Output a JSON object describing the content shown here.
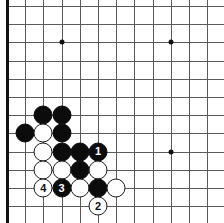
{
  "diagram": {
    "kind": "go-board-diagram",
    "board": {
      "width_px": 224,
      "height_px": 223,
      "origin_x": 7,
      "origin_y": 6,
      "spacing": 18.2,
      "cols": 12,
      "rows": 12,
      "line_color": "#5a5a5a",
      "edge_color": "#111111",
      "background": "#ffffff"
    },
    "star_points": [
      {
        "name": "star-point-top-left",
        "col": 3,
        "row": 2
      },
      {
        "name": "star-point-top-right",
        "col": 9,
        "row": 2
      },
      {
        "name": "star-point-right",
        "col": 9,
        "row": 8
      }
    ],
    "stones": [
      {
        "name": "black-stone-a",
        "color": "black",
        "col": 2,
        "row": 6,
        "label": ""
      },
      {
        "name": "black-stone-b",
        "color": "black",
        "col": 3,
        "row": 6,
        "label": ""
      },
      {
        "name": "black-stone-c",
        "color": "black",
        "col": 1,
        "row": 7,
        "label": ""
      },
      {
        "name": "white-stone-a",
        "color": "white",
        "col": 2,
        "row": 7,
        "label": ""
      },
      {
        "name": "black-stone-d",
        "color": "black",
        "col": 3,
        "row": 7,
        "label": ""
      },
      {
        "name": "white-stone-b",
        "color": "white",
        "col": 2,
        "row": 8,
        "label": ""
      },
      {
        "name": "black-stone-e",
        "color": "black",
        "col": 3,
        "row": 8,
        "label": ""
      },
      {
        "name": "black-stone-f",
        "color": "black",
        "col": 4,
        "row": 8,
        "label": ""
      },
      {
        "name": "black-move-1",
        "color": "black",
        "col": 5,
        "row": 8,
        "label": "1"
      },
      {
        "name": "white-stone-c",
        "color": "white",
        "col": 2,
        "row": 9,
        "label": ""
      },
      {
        "name": "white-stone-d",
        "color": "white",
        "col": 3,
        "row": 9,
        "label": ""
      },
      {
        "name": "black-stone-g",
        "color": "black",
        "col": 4,
        "row": 9,
        "label": ""
      },
      {
        "name": "white-stone-e",
        "color": "white",
        "col": 5,
        "row": 9,
        "label": ""
      },
      {
        "name": "white-move-4",
        "color": "white",
        "col": 2,
        "row": 10,
        "label": "4"
      },
      {
        "name": "black-move-3",
        "color": "black",
        "col": 3,
        "row": 10,
        "label": "3"
      },
      {
        "name": "white-stone-f",
        "color": "white",
        "col": 4,
        "row": 10,
        "label": ""
      },
      {
        "name": "black-stone-h",
        "color": "black",
        "col": 5,
        "row": 10,
        "label": ""
      },
      {
        "name": "white-stone-g",
        "color": "white",
        "col": 6,
        "row": 10,
        "label": ""
      },
      {
        "name": "white-move-2",
        "color": "white",
        "col": 5,
        "row": 11,
        "label": "2"
      }
    ],
    "move_labels": [
      "1",
      "2",
      "3",
      "4"
    ]
  }
}
